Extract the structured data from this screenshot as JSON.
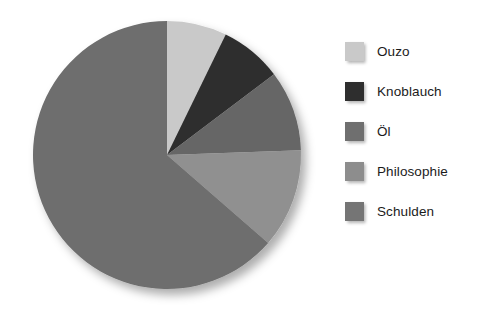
{
  "chart_data": {
    "type": "pie",
    "title": "",
    "subtitle": "",
    "xlabel": "",
    "ylabel": "",
    "grid": false,
    "legend_position": "right",
    "start_angle_deg": 0,
    "direction": "clockwise",
    "categories": [
      "Ouzo",
      "Knoblauch",
      "Öl",
      "Philosophie",
      "Schulden"
    ],
    "values": [
      7.2,
      7.5,
      9.7,
      12.0,
      63.6
    ],
    "units": "percent",
    "angles_deg": [
      26,
      27,
      35,
      43,
      229
    ],
    "colors": [
      "#c9c9c9",
      "#2e2e2e",
      "#666666",
      "#909090",
      "#6e6e6e"
    ],
    "slices": [
      {
        "label": "Ouzo",
        "value": 7.2,
        "angle_deg": 26,
        "color": "#c9c9c9"
      },
      {
        "label": "Knoblauch",
        "value": 7.5,
        "angle_deg": 27,
        "color": "#2e2e2e"
      },
      {
        "label": "Öl",
        "value": 9.7,
        "angle_deg": 35,
        "color": "#666666"
      },
      {
        "label": "Philosophie",
        "value": 12.0,
        "angle_deg": 43,
        "color": "#909090"
      },
      {
        "label": "Schulden",
        "value": 63.6,
        "angle_deg": 229,
        "color": "#6e6e6e"
      }
    ]
  },
  "legend": {
    "items": [
      {
        "label": "Ouzo",
        "color": "#c9c9c9"
      },
      {
        "label": "Knoblauch",
        "color": "#2e2e2e"
      },
      {
        "label": "Öl",
        "color": "#6f6f6f"
      },
      {
        "label": "Philosophie",
        "color": "#8d8d8d"
      },
      {
        "label": "Schulden",
        "color": "#757575"
      }
    ]
  },
  "geometry": {
    "center_x": 167,
    "center_y": 155,
    "radius": 134
  }
}
